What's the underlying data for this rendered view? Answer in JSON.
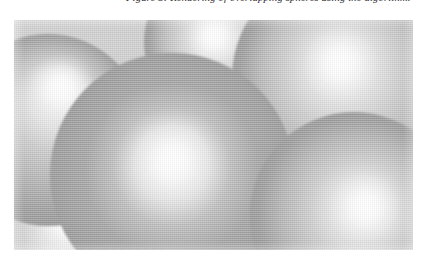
{
  "caption": {
    "text": "Figure 5: Rendering of overlapping spheres using the algorithm.",
    "style": "italic",
    "visible_fragment": "descenders only (top of line cropped by page edge)"
  },
  "figure": {
    "name": "sphere-render",
    "frame": {
      "x": 14,
      "y": 20,
      "width": 399,
      "height": 230
    },
    "background_color": "#cfcfcf",
    "palette": {
      "highlight": "#ffffff",
      "light_gray": "#e8e8e8",
      "mid_gray": "#c8c8c8",
      "shadow_gray": "#ababab",
      "deep_gray": "#9d9d9d",
      "page_white": "#ffffff"
    },
    "render_style": "halftone-scan",
    "spheres": [
      {
        "id": "sphere-center-front",
        "label": "large foreground sphere",
        "cx": 158,
        "cy": 155,
        "r": 122,
        "highlight_x": 158,
        "highlight_y": 140,
        "base_color": "#bdbdbd",
        "shade_color": "#a4a4a4",
        "z": 5
      },
      {
        "id": "sphere-left",
        "label": "left sphere",
        "cx": 34,
        "cy": 110,
        "r": 96,
        "highlight_x": 48,
        "highlight_y": 65,
        "base_color": "#cacaca",
        "shade_color": "#b2b2b2",
        "z": 2
      },
      {
        "id": "sphere-top-middle",
        "label": "upper middle sphere",
        "cx": 208,
        "cy": 22,
        "r": 78,
        "highlight_x": 199,
        "highlight_y": 16,
        "base_color": "#d2d2d2",
        "shade_color": "#bcbcbc",
        "z": 3
      },
      {
        "id": "sphere-right-upper",
        "label": "right upper sphere",
        "cx": 330,
        "cy": 58,
        "r": 112,
        "highlight_x": 326,
        "highlight_y": 42,
        "base_color": "#d0d0d0",
        "shade_color": "#bababa",
        "z": 4
      },
      {
        "id": "sphere-right-lower",
        "label": "right lower sphere",
        "cx": 340,
        "cy": 196,
        "r": 104,
        "highlight_x": 352,
        "highlight_y": 186,
        "base_color": "#cdcdcd",
        "shade_color": "#b6b6b6",
        "z": 6
      },
      {
        "id": "sphere-bottom-left",
        "label": "bottom left sphere",
        "cx": 40,
        "cy": 226,
        "r": 88,
        "highlight_x": 56,
        "highlight_y": 200,
        "base_color": "#cfcfcf",
        "shade_color": "#b8b8b8",
        "z": 1
      }
    ]
  }
}
